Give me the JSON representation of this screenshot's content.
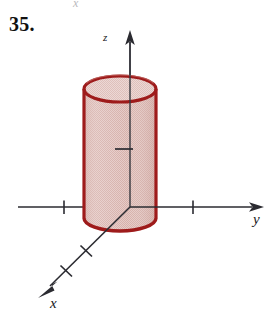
{
  "figure": {
    "problem_number": "35.",
    "stray_mark_top": "x",
    "caption_note": "Solid cylinder centered on the z-axis in a 3D xyz coordinate system",
    "axes": {
      "z": {
        "label": "z",
        "direction": "up",
        "origin": [
          130,
          207
        ],
        "arrow_tip": [
          130,
          32
        ],
        "ticks": [
          {
            "at": [
              124,
              149
            ],
            "orientation": "horizontal"
          }
        ]
      },
      "y": {
        "label": "y",
        "direction": "right",
        "start": [
          18,
          207
        ],
        "arrow_tip": [
          263,
          207
        ],
        "ticks": [
          {
            "at": [
              64,
              207
            ],
            "orientation": "vertical",
            "side": "negative"
          },
          {
            "at": [
              193,
              207
            ],
            "orientation": "vertical",
            "side": "positive"
          }
        ]
      },
      "x": {
        "label": "x",
        "direction": "down-left",
        "origin": [
          130,
          207
        ],
        "arrow_tip": [
          40,
          296
        ],
        "ticks": [
          {
            "at": [
              86,
              251
            ],
            "orientation": "perpendicular"
          },
          {
            "at": [
              66,
              271
            ],
            "orientation": "perpendicular"
          }
        ]
      }
    },
    "solid": {
      "shape": "cylinder",
      "axis": "z",
      "center_x": 120,
      "radius_px": 36,
      "ellipse_ry_px": 13,
      "top_cy": 89,
      "bottom_cy": 218,
      "outline_color": "#9e1b1b",
      "fill_color": "#ddbcb7",
      "fill_texture": "dither",
      "outline_width": 3.2
    },
    "colors": {
      "background": "#ffffff",
      "axis_line": "#2b2b31",
      "text": "#111111",
      "solid_outline": "#9e1b1b",
      "solid_fill": "#ddbcb7",
      "solid_fill_highlight": "#eadcd9",
      "stray_mark": "#b9b9bd"
    }
  }
}
